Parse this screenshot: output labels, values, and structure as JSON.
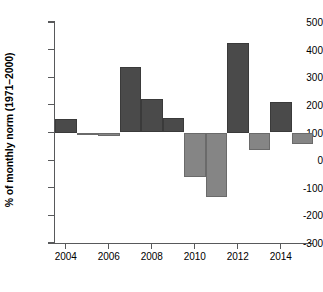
{
  "chart_data": {
    "type": "bar",
    "title": "",
    "xlabel": "",
    "ylabel": "% of monthly norm (1971–2000)",
    "categories": [
      "2004",
      "2005",
      "2006",
      "2007",
      "2008",
      "2009",
      "2010",
      "2011",
      "2012",
      "2013",
      "2014",
      "2015"
    ],
    "values": [
      150,
      90,
      87,
      338,
      222,
      153,
      -60,
      -135,
      425,
      35,
      210,
      58
    ],
    "series": [
      {
        "name": "% of monthly norm (1971–2000)",
        "values": [
          150,
          90,
          87,
          338,
          222,
          153,
          -60,
          -135,
          425,
          35,
          210,
          58
        ],
        "colors": [
          "dark",
          "light",
          "light",
          "dark",
          "dark",
          "dark",
          "light",
          "light",
          "dark",
          "light",
          "dark",
          "light"
        ]
      }
    ],
    "baseline": 100,
    "ylim": [
      -300,
      500
    ],
    "xlim": [
      2003.5,
      2015.5
    ],
    "ytick_labels": [
      "500",
      "400",
      "300",
      "200",
      "100",
      "0",
      "-100",
      "-200",
      "-300"
    ],
    "ytick_values": [
      500,
      400,
      300,
      200,
      100,
      0,
      -100,
      -200,
      -300
    ],
    "xtick_labels": [
      "2004",
      "2006",
      "2008",
      "2010",
      "2012",
      "2014"
    ],
    "xtick_values": [
      2004,
      2006,
      2008,
      2010,
      2012,
      2014
    ],
    "grid": false,
    "legend": null,
    "colors": {
      "bar_above_baseline": "#4a4a4a",
      "bar_below_baseline": "#858585",
      "axis": "#58595b",
      "text": "#000000",
      "background": "#ffffff"
    }
  }
}
